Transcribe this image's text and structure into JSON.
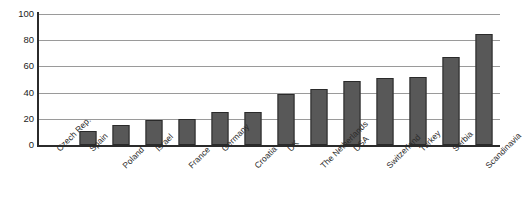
{
  "chart_data": {
    "type": "bar",
    "title": "",
    "subtitle": "",
    "xlabel": "",
    "ylabel": "",
    "ylim": [
      0,
      100
    ],
    "yticks": [
      0,
      20,
      40,
      60,
      80,
      100
    ],
    "grid": true,
    "legend": false,
    "legend_position": "none",
    "bar_color": "#585858",
    "bar_border_color": "#2a2a2a",
    "gridline_color": "#9a9a9a",
    "axis_color": "#2b2b2b",
    "categories": [
      "Czech Rep.",
      "Spain",
      "Poland",
      "Israel",
      "France",
      "Germany",
      "Croatia",
      "UK",
      "The Netherlands",
      "USA",
      "Switzerland",
      "Turkey",
      "Serbia",
      "Scandinavia"
    ],
    "values": [
      0,
      11,
      15,
      19,
      20,
      25,
      25,
      39,
      43,
      49,
      51,
      52,
      67,
      85
    ],
    "label_rows": [
      1,
      1,
      2,
      1,
      2,
      1,
      2,
      1,
      2,
      1,
      2,
      1,
      1,
      2
    ]
  }
}
